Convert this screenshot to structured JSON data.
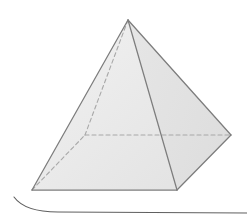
{
  "figure": {
    "title": "Square pyramid",
    "type": "3d-geometric-solid",
    "background_color": "#ffffff",
    "canvas": {
      "width": 247,
      "height": 219
    }
  },
  "geometry": {
    "vertices": {
      "apex": {
        "name": "apex",
        "x": 128,
        "y": 20,
        "hidden": false
      },
      "left": {
        "name": "base-left",
        "x": 32,
        "y": 190,
        "hidden": false
      },
      "front": {
        "name": "base-front",
        "x": 177,
        "y": 190,
        "hidden": false
      },
      "right": {
        "name": "base-right",
        "x": 231,
        "y": 135,
        "hidden": false
      },
      "back": {
        "name": "base-back-hidden",
        "x": 85,
        "y": 135,
        "hidden": true
      }
    },
    "faces": [
      {
        "name": "left-face",
        "points": "128,20 32,190 85,135",
        "fill": "#f2f2f2"
      },
      {
        "name": "front-left-face",
        "points": "128,20 32,190 177,190",
        "fill": "#e9e9e9"
      },
      {
        "name": "front-right-face",
        "points": "128,20 177,190 231,135",
        "fill": "#e2e2e2"
      },
      {
        "name": "base-quad",
        "points": "32,190 85,135 231,135 177,190",
        "fill": "#ececec"
      }
    ],
    "visible_edges": [
      {
        "name": "edge-apex-left",
        "x1": 128,
        "y1": 20,
        "x2": 32,
        "y2": 190
      },
      {
        "name": "edge-apex-front",
        "x1": 128,
        "y1": 20,
        "x2": 177,
        "y2": 190
      },
      {
        "name": "edge-apex-right",
        "x1": 128,
        "y1": 20,
        "x2": 231,
        "y2": 135
      },
      {
        "name": "edge-base-left-front",
        "x1": 32,
        "y1": 190,
        "x2": 177,
        "y2": 190
      },
      {
        "name": "edge-base-front-right",
        "x1": 177,
        "y1": 190,
        "x2": 231,
        "y2": 135
      }
    ],
    "hidden_edges": [
      {
        "name": "edge-apex-back",
        "x1": 128,
        "y1": 20,
        "x2": 85,
        "y2": 135
      },
      {
        "name": "edge-base-left-back",
        "x1": 32,
        "y1": 190,
        "x2": 85,
        "y2": 135
      },
      {
        "name": "edge-base-back-right",
        "x1": 85,
        "y1": 135,
        "x2": 231,
        "y2": 135
      }
    ]
  },
  "style": {
    "edge_color": "#7d7d7d",
    "hidden_edge_color": "#a8a8a8",
    "hidden_edge_dash": "4 3",
    "edge_width": 1.2,
    "fill_light": "#f2f2f2",
    "fill_mid": "#e9e9e9",
    "fill_dark": "#e2e2e2",
    "page_curl_color": "#6b6b6b"
  },
  "page_artifact": {
    "name": "page-edge-curl",
    "description": "Faint curved scanned page edge line along the bottom of the image",
    "path": "M 14 197 C 22 208, 38 212, 58 212 L 247 213",
    "stroke": "#5f5f5f",
    "stroke_width": 1.1
  },
  "labels": []
}
